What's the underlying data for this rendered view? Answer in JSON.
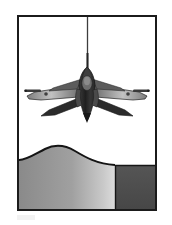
{
  "figure": {
    "frame": {
      "border_color": "#1b1b1b",
      "border_width_px": 2,
      "background_color": "#ffffff",
      "x": 17,
      "y": 15,
      "width": 140,
      "height": 196
    },
    "page_background_color": "#ffffff"
  },
  "scene": {
    "sky": {
      "label": "sky",
      "color": "#ffffff"
    },
    "trail_line": {
      "label": "vertical-trail-line",
      "color": "#3a3a3a",
      "x": 69,
      "y_top": 2,
      "y_bottom": 52,
      "width_px": 1.4
    },
    "aircraft": {
      "label": "jet-fighter",
      "view": "front-plan",
      "span_px": 110,
      "center_x": 70,
      "center_y": 72,
      "colors": {
        "fuselage_dark": "#262626",
        "fuselage_mid": "#4a4a4a",
        "wing_light": "#b9b9b9",
        "wing_mid": "#8d8d8d",
        "canopy": "#6f6f6f",
        "outline": "#1a1a1a"
      },
      "parts": [
        "nose",
        "canopy",
        "fuselage",
        "left-wing",
        "right-wing",
        "left-wingtip-missile",
        "right-wingtip-missile",
        "left-tailplane",
        "right-tailplane",
        "engine-exhaust"
      ]
    },
    "terrain": {
      "label": "ground",
      "hill": {
        "label": "gradient-hill",
        "gradient_from": "#8f8f8f",
        "gradient_to": "#d2d2d2",
        "outline_color": "#1a1a1a",
        "left_edge_y": 142,
        "crest_x": 46,
        "crest_y": 131,
        "right_edge_x": 96,
        "right_edge_y": 148
      },
      "block": {
        "label": "dark-terrain-block",
        "color": "#4f4f4f",
        "x": 96,
        "y": 148,
        "width": 44,
        "height": 48
      }
    }
  },
  "colors": {
    "ink": "#1b1b1b",
    "paper": "#ffffff",
    "mid_gray": "#8f8f8f",
    "light_gray": "#d2d2d2",
    "dark_gray": "#4f4f4f"
  }
}
